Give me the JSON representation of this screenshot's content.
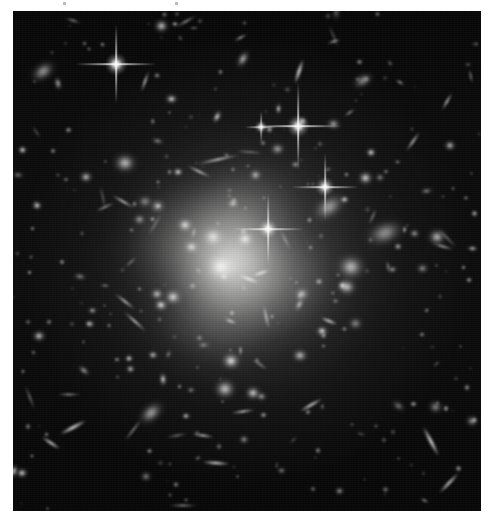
{
  "page": {
    "background_color": "#ffffff",
    "width": 491,
    "height": 523
  },
  "image_plate": {
    "name": "galaxy-cluster-photograph",
    "alt_text": "Deep telescope image of a rich galaxy cluster with a bright diffuse core, hundreds of elliptical galaxies, foreground stars with four-point diffraction spikes, and thin gravitationally lensed arcs.",
    "left": 13,
    "top": 11,
    "width": 468,
    "height": 500,
    "sky_color": "#0a0a0a",
    "halo_color": "#9a9a9a",
    "object_color": "#ffffff",
    "border_color": "#2a2a2a",
    "rendering": "grayscale"
  },
  "margin_marks": [
    {
      "left": 63,
      "top": 2,
      "width": 3,
      "height": 3
    },
    {
      "left": 175,
      "top": 2,
      "width": 3,
      "height": 3
    }
  ],
  "chart_data": {
    "type": "scatter",
    "xlabel": "",
    "ylabel": "",
    "xlim": [
      0,
      468
    ],
    "ylim": [
      0,
      500
    ],
    "grid": false,
    "legend": "none",
    "halo": {
      "cx": 232,
      "cy": 250,
      "rx": 150,
      "ry": 140,
      "peak_brightness": 0.42
    },
    "core_glow": {
      "cx": 218,
      "cy": 252,
      "rx": 62,
      "ry": 58,
      "peak_brightness": 0.8
    },
    "series": [
      {
        "name": "bright-ellipticals",
        "points": [
          {
            "x": 208,
            "y": 256,
            "size": 34,
            "brightness": 1.0,
            "angle": 0
          },
          {
            "x": 200,
            "y": 226,
            "size": 24,
            "brightness": 0.95,
            "angle": 0
          },
          {
            "x": 232,
            "y": 228,
            "size": 20,
            "brightness": 0.9,
            "angle": 0
          },
          {
            "x": 172,
            "y": 214,
            "size": 18,
            "brightness": 0.92,
            "angle": 0
          },
          {
            "x": 178,
            "y": 236,
            "size": 17,
            "brightness": 0.88,
            "angle": 0
          },
          {
            "x": 160,
            "y": 286,
            "size": 20,
            "brightness": 0.9,
            "angle": 0
          },
          {
            "x": 218,
            "y": 350,
            "size": 22,
            "brightness": 0.95,
            "angle": 0
          },
          {
            "x": 212,
            "y": 378,
            "size": 24,
            "brightness": 0.97,
            "angle": 0
          },
          {
            "x": 240,
            "y": 382,
            "size": 18,
            "brightness": 0.9,
            "angle": 0
          },
          {
            "x": 316,
            "y": 196,
            "size": 40,
            "brightness": 0.85,
            "angle": -35
          },
          {
            "x": 372,
            "y": 222,
            "size": 44,
            "brightness": 0.82,
            "angle": -20
          },
          {
            "x": 338,
            "y": 256,
            "size": 32,
            "brightness": 0.88,
            "angle": 0
          },
          {
            "x": 334,
            "y": 276,
            "size": 22,
            "brightness": 0.8,
            "angle": 0
          },
          {
            "x": 112,
            "y": 152,
            "size": 26,
            "brightness": 0.92,
            "angle": 0
          },
          {
            "x": 138,
            "y": 402,
            "size": 32,
            "brightness": 0.86,
            "angle": -40
          },
          {
            "x": 30,
            "y": 60,
            "size": 30,
            "brightness": 0.85,
            "angle": -35
          },
          {
            "x": 350,
            "y": 70,
            "size": 24,
            "brightness": 0.82,
            "angle": -30
          },
          {
            "x": 230,
            "y": 48,
            "size": 22,
            "brightness": 0.8,
            "angle": -60
          },
          {
            "x": 424,
            "y": 226,
            "size": 22,
            "brightness": 0.78,
            "angle": 0
          }
        ]
      },
      {
        "name": "foreground-stars-with-spikes",
        "points": [
          {
            "x": 103,
            "y": 53,
            "size": 9,
            "brightness": 1.0,
            "spike_len": 40
          },
          {
            "x": 285,
            "y": 115,
            "size": 9,
            "brightness": 1.0,
            "spike_len": 44
          },
          {
            "x": 312,
            "y": 176,
            "size": 8,
            "brightness": 0.95,
            "spike_len": 34
          },
          {
            "x": 255,
            "y": 218,
            "size": 8,
            "brightness": 0.98,
            "spike_len": 36
          },
          {
            "x": 248,
            "y": 116,
            "size": 5,
            "brightness": 0.8,
            "spike_len": 16
          }
        ]
      },
      {
        "name": "lensing-arcs-and-edge-on-disks",
        "points": [
          {
            "x": 205,
            "y": 148,
            "length": 44,
            "width": 3,
            "angle": -12
          },
          {
            "x": 186,
            "y": 160,
            "length": 26,
            "width": 3,
            "angle": 26
          },
          {
            "x": 110,
            "y": 190,
            "length": 26,
            "width": 3,
            "angle": 30
          },
          {
            "x": 92,
            "y": 196,
            "length": 22,
            "width": 2,
            "angle": -25
          },
          {
            "x": 112,
            "y": 290,
            "length": 26,
            "width": 3,
            "angle": 38
          },
          {
            "x": 122,
            "y": 310,
            "length": 30,
            "width": 3,
            "angle": 42
          },
          {
            "x": 236,
            "y": 268,
            "length": 22,
            "width": 4,
            "angle": 20
          },
          {
            "x": 248,
            "y": 262,
            "length": 18,
            "width": 4,
            "angle": -18
          },
          {
            "x": 203,
            "y": 452,
            "length": 28,
            "width": 4,
            "angle": 4
          },
          {
            "x": 190,
            "y": 424,
            "length": 22,
            "width": 3,
            "angle": 8
          },
          {
            "x": 230,
            "y": 400,
            "length": 24,
            "width": 3,
            "angle": -8
          },
          {
            "x": 418,
            "y": 430,
            "length": 34,
            "width": 5,
            "angle": 62
          },
          {
            "x": 436,
            "y": 472,
            "length": 28,
            "width": 4,
            "angle": -46
          },
          {
            "x": 298,
            "y": 394,
            "length": 26,
            "width": 4,
            "angle": -30
          },
          {
            "x": 60,
            "y": 416,
            "length": 30,
            "width": 5,
            "angle": -28
          },
          {
            "x": 38,
            "y": 432,
            "length": 22,
            "width": 4,
            "angle": 34
          },
          {
            "x": 400,
            "y": 130,
            "length": 24,
            "width": 3,
            "angle": -55
          },
          {
            "x": 434,
            "y": 90,
            "length": 20,
            "width": 3,
            "angle": -60
          },
          {
            "x": 286,
            "y": 60,
            "length": 26,
            "width": 5,
            "angle": -72
          },
          {
            "x": 132,
            "y": 70,
            "length": 22,
            "width": 3,
            "angle": -70
          },
          {
            "x": 316,
            "y": 310,
            "length": 18,
            "width": 4,
            "angle": 22
          }
        ]
      },
      {
        "name": "faint-field-points",
        "count": 180,
        "brightness_range": [
          0.25,
          0.85
        ],
        "size_range": [
          2,
          7
        ]
      }
    ]
  }
}
